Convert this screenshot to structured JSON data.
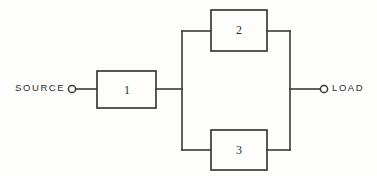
{
  "diagram": {
    "line_color": "#3a3a3a",
    "background_color": "#fdfdfb",
    "ports": {
      "input": {
        "label": "SOURCE",
        "terminal_icon": "open-circle-terminal"
      },
      "output": {
        "label": "LOAD",
        "terminal_icon": "open-circle-terminal"
      }
    },
    "blocks": [
      {
        "id": "block-1",
        "label": "1",
        "position": "series-input-stage"
      },
      {
        "id": "block-2",
        "label": "2",
        "position": "parallel-upper-branch"
      },
      {
        "id": "block-3",
        "label": "3",
        "position": "parallel-lower-branch"
      }
    ],
    "connections": [
      "source-terminal to block-1 input",
      "block-1 output to parallel-bus-left",
      "parallel-bus-left to block-2 input",
      "parallel-bus-left to block-3 input",
      "block-2 output to parallel-bus-right",
      "block-3 output to parallel-bus-right",
      "parallel-bus-right to load-terminal"
    ]
  }
}
